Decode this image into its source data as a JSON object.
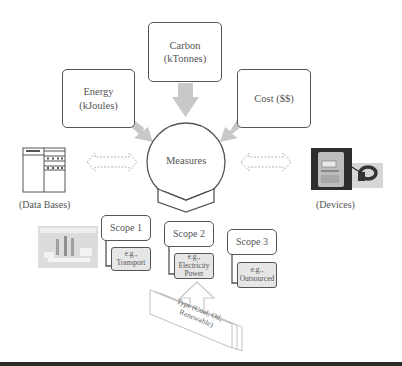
{
  "diagram": {
    "measure_inputs": [
      {
        "id": "carbon",
        "line1": "Carbon",
        "line2": "(kTonnes)"
      },
      {
        "id": "energy",
        "line1": "Energy",
        "line2": "(kJoules)"
      },
      {
        "id": "cost",
        "line1": "Cost ($$)",
        "line2": ""
      }
    ],
    "center": {
      "label": "Measures"
    },
    "left_source": {
      "label": "(Data Bases)",
      "icon": "database-icon"
    },
    "right_source": {
      "label": "(Devices)",
      "icon": "meter-device-icon"
    },
    "scopes": [
      {
        "title": "Scope 1",
        "example_line1": "e.g.,",
        "example_line2": "Transport",
        "example_line3": ""
      },
      {
        "title": "Scope 2",
        "example_line1": "e.g.,",
        "example_line2": "Electricity",
        "example_line3": "Power"
      },
      {
        "title": "Scope 3",
        "example_line1": "e.g.,",
        "example_line2": "Outsourced",
        "example_line3": ""
      }
    ],
    "type_stack": {
      "line1": "Type (Coal, Oil,",
      "line2": "Renewable)"
    },
    "colors": {
      "stroke": "#555555",
      "arrow_fill": "#c8c8c8",
      "sub_box_fill": "#e6e6e6",
      "dashed_arrow": "#aaaaaa",
      "bottom_bar": "#2a2a2a"
    }
  }
}
